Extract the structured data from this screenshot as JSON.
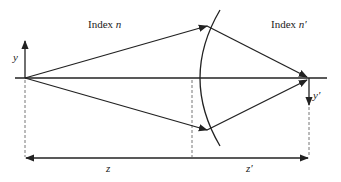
{
  "diagram": {
    "title": "",
    "labels": {
      "index_left_prefix": "Index ",
      "index_left_var": "n",
      "index_right_prefix": "Index ",
      "index_right_var": "n′",
      "y_axis": "y",
      "y_prime": "y′",
      "z": "z",
      "z_prime": "z′"
    },
    "colors": {
      "line": "#222222",
      "dashed": "#666666",
      "background": "#ffffff"
    },
    "elements": [
      "optical-axis",
      "object-height-arrow-y",
      "refracting-spherical-surface",
      "upper-ray",
      "lower-ray",
      "image-height-arrow-y-prime",
      "distance-z",
      "distance-z-prime"
    ]
  }
}
